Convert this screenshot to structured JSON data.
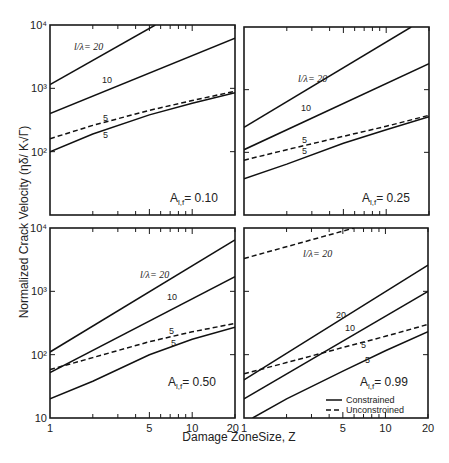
{
  "figure": {
    "ylabel": "Normalized Crack Velocity (ηδ/ K√Γ)",
    "xlabel": "Damage ZoneSize, Z",
    "x_ticks": [
      "1",
      "5",
      "10",
      "20"
    ],
    "legend": [
      {
        "label": "Constrained",
        "style": "solid"
      },
      {
        "label": "Unconstroined",
        "style": "dashed"
      }
    ]
  },
  "chart_data": [
    {
      "type": "line",
      "panel": "top-left",
      "annotation": "A_l,f = 0.10",
      "annotation_main": "A",
      "annotation_sub": "l,f",
      "annotation_value": "= 0.10",
      "xscale": "log",
      "yscale": "log",
      "xlim": [
        1,
        20
      ],
      "ylim": [
        10,
        10000
      ],
      "y_ticks": [
        "10⁴",
        "10³",
        "10²"
      ],
      "series": [
        {
          "name": "l/λ = 20",
          "style": "solid",
          "label": "l/λ= 20",
          "x": [
            1,
            5.5
          ],
          "y": [
            1150,
            10000
          ]
        },
        {
          "name": "l/λ = 10",
          "style": "solid",
          "label": "10",
          "x": [
            1,
            20
          ],
          "y": [
            400,
            6200
          ]
        },
        {
          "name": "l/λ = 5 (unconstrained)",
          "style": "dashed",
          "label": "5",
          "x": [
            1,
            2,
            5,
            10,
            20
          ],
          "y": [
            160,
            260,
            450,
            640,
            900
          ]
        },
        {
          "name": "l/λ = 5 (constrained)",
          "style": "solid",
          "label": "5",
          "x": [
            1,
            2,
            5,
            10,
            20
          ],
          "y": [
            100,
            190,
            380,
            580,
            850
          ]
        }
      ]
    },
    {
      "type": "line",
      "panel": "top-right",
      "annotation": "A_l,f = 0.25",
      "annotation_main": "A",
      "annotation_sub": "l,f",
      "annotation_value": "= 0.25",
      "xscale": "log",
      "yscale": "log",
      "xlim": [
        1,
        20
      ],
      "ylim": [
        10,
        10000
      ],
      "y_ticks": [],
      "series": [
        {
          "name": "l/λ = 20",
          "style": "solid",
          "label": "l/λ= 20",
          "x": [
            1,
            15
          ],
          "y": [
            250,
            10000
          ]
        },
        {
          "name": "l/λ = 10",
          "style": "solid",
          "label": "10",
          "x": [
            1,
            20
          ],
          "y": [
            110,
            2600
          ]
        },
        {
          "name": "l/λ = 5 (unconstrained)",
          "style": "dashed",
          "label": "5",
          "x": [
            1,
            2,
            5,
            10,
            20
          ],
          "y": [
            75,
            110,
            180,
            260,
            390
          ]
        },
        {
          "name": "l/λ = 5 (constrained)",
          "style": "solid",
          "label": "5",
          "x": [
            1,
            2,
            5,
            10,
            20
          ],
          "y": [
            38,
            65,
            140,
            230,
            370
          ]
        }
      ]
    },
    {
      "type": "line",
      "panel": "bottom-left",
      "annotation": "A_l,f = 0.50",
      "annotation_main": "A",
      "annotation_sub": "l,f",
      "annotation_value": "= 0.50",
      "xscale": "log",
      "yscale": "log",
      "xlim": [
        1,
        20
      ],
      "ylim": [
        10,
        10000
      ],
      "y_ticks": [
        "10⁴",
        "10³",
        "10²",
        "10"
      ],
      "series": [
        {
          "name": "l/λ = 20",
          "style": "solid",
          "label": "l/λ= 20",
          "x": [
            1,
            20
          ],
          "y": [
            110,
            6500
          ]
        },
        {
          "name": "l/λ = 10",
          "style": "solid",
          "label": "10",
          "x": [
            1,
            20
          ],
          "y": [
            52,
            1700
          ]
        },
        {
          "name": "l/λ = 5 (unconstrained)",
          "style": "dashed",
          "label": "5",
          "x": [
            1,
            2,
            5,
            10,
            20
          ],
          "y": [
            58,
            90,
            160,
            230,
            310
          ]
        },
        {
          "name": "l/λ = 5 (constrained)",
          "style": "solid",
          "label": "5",
          "x": [
            1,
            2,
            5,
            10,
            20
          ],
          "y": [
            20,
            38,
            100,
            175,
            270
          ]
        }
      ]
    },
    {
      "type": "line",
      "panel": "bottom-right",
      "annotation": "A_l,f = 0.99",
      "annotation_main": "A",
      "annotation_sub": "l,f",
      "annotation_value": "= 0.99",
      "xscale": "log",
      "yscale": "log",
      "xlim": [
        1,
        20
      ],
      "ylim": [
        10,
        10000
      ],
      "y_ticks": [],
      "series": [
        {
          "name": "l/λ = 20 (unconstrained)",
          "style": "dashed",
          "label": "l/λ= 20",
          "x": [
            1,
            6
          ],
          "y": [
            3300,
            10000
          ]
        },
        {
          "name": "l/λ = 20 (constrained)",
          "style": "solid",
          "label": "20",
          "x": [
            1,
            20
          ],
          "y": [
            40,
            2600
          ]
        },
        {
          "name": "l/λ = 10 (constrained)",
          "style": "solid",
          "label": "10",
          "x": [
            1,
            20
          ],
          "y": [
            20,
            1000
          ]
        },
        {
          "name": "l/λ = 5 (unconstrained)",
          "style": "dashed",
          "label": "5",
          "x": [
            1,
            2,
            5,
            10,
            20
          ],
          "y": [
            50,
            75,
            130,
            195,
            300
          ]
        },
        {
          "name": "l/λ = 5 (constrained)",
          "style": "solid",
          "label": "5",
          "x": [
            1.15,
            2,
            5,
            10,
            20
          ],
          "y": [
            10,
            20,
            55,
            115,
            230
          ]
        }
      ]
    }
  ]
}
